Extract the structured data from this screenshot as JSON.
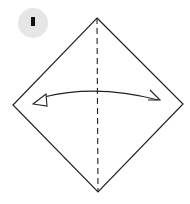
{
  "diagram": {
    "type": "origami-step",
    "step": {
      "number": "1",
      "badge_color": "#e6e6e6",
      "number_color": "#111111"
    },
    "paper": {
      "shape": "square-rotated-45",
      "stroke_color": "#222222",
      "fill_color": "#ffffff"
    },
    "fold_line": {
      "type": "valley-fold",
      "style": "dashed",
      "orientation": "vertical"
    },
    "arrow": {
      "type": "fold-and-unfold",
      "direction": "bidirectional-horizontal"
    },
    "colors": {
      "background": "#ffffff",
      "line": "#222222"
    }
  }
}
